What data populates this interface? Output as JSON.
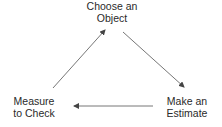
{
  "diagram": {
    "type": "cycle",
    "nodes": [
      {
        "id": "top",
        "lines": [
          "Choose an",
          "Object"
        ]
      },
      {
        "id": "right",
        "lines": [
          "Make an",
          "Estimate"
        ]
      },
      {
        "id": "left",
        "lines": [
          "Measure",
          "to Check"
        ]
      }
    ],
    "edges": [
      {
        "from": "top",
        "to": "right"
      },
      {
        "from": "right",
        "to": "left"
      },
      {
        "from": "left",
        "to": "top"
      }
    ],
    "colors": {
      "text": "#2a2a2a",
      "arrow": "#555555",
      "background": "#ffffff"
    }
  }
}
